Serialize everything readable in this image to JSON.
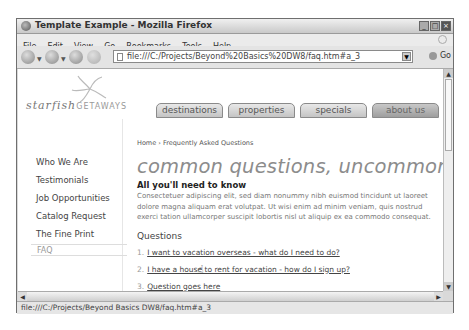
{
  "window": {
    "title": "Template Example - Mozilla Firefox",
    "controls": [
      "minimize",
      "maximize",
      "close"
    ]
  },
  "menubar": [
    "File",
    "Edit",
    "View",
    "Go",
    "Bookmarks",
    "Tools",
    "Help"
  ],
  "toolbar": {
    "back_icon": "back-arrow-icon",
    "forward_icon": "forward-arrow-icon",
    "reload_icon": "reload-icon",
    "stop_icon": "stop-icon",
    "home_icon": "home-icon",
    "bookmark_icon": "bookmark-icon",
    "url": "file:///C:/Projects/Beyond%20Basics%20DW8/faq.htm#a_3",
    "go_label": "Go"
  },
  "site": {
    "logo_script": "starfish",
    "logo_caps": "GETAWAYS",
    "tabs": [
      {
        "label": "destinations",
        "active": false
      },
      {
        "label": "properties",
        "active": false
      },
      {
        "label": "specials",
        "active": false
      },
      {
        "label": "about us",
        "active": true
      },
      {
        "label": "contact",
        "active": false
      }
    ],
    "sidebar": [
      "Who We Are",
      "Testimonials",
      "Job Opportunities",
      "Catalog Request",
      "The Fine Print"
    ],
    "sidebar_current": "FAQ",
    "breadcrumb": "Home › Frequently Asked Questions",
    "heading": "common questions, uncommon answers",
    "subheading": "All you'll need to know",
    "paragraph": "Consectetuer adipiscing elit, sed diam nonummy nibh euismod tincidunt ut laoreet dolore magna aliquam erat volutpat. Ut wisi enim ad minim veniam, quis nostrud exerci tation ullamcorper suscipit lobortis nisl ut aliquip ex ea commodo consequat.",
    "questions_heading": "Questions",
    "questions": [
      {
        "num": "1.",
        "text": "I want to vacation overseas - what do I need to do?"
      },
      {
        "num": "2.",
        "text": "I have a house to rent for vacation - how do I sign up?"
      },
      {
        "num": "3.",
        "text": "Question goes here"
      },
      {
        "num": "4.",
        "text": "Question goes here"
      }
    ]
  },
  "statusbar": "file:///C:/Projects/Beyond Basics DW8/faq.htm#a_3"
}
